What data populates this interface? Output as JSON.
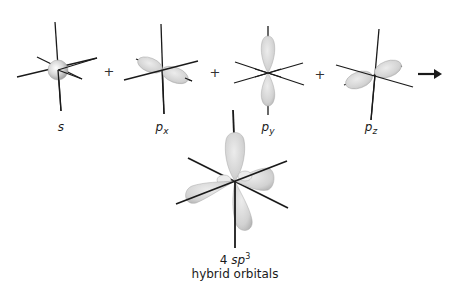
{
  "figure": {
    "orbitals": [
      {
        "id": "s",
        "symbol": "s",
        "subscript": ""
      },
      {
        "id": "px",
        "symbol": "p",
        "subscript": "x"
      },
      {
        "id": "py",
        "symbol": "p",
        "subscript": "y"
      },
      {
        "id": "pz",
        "symbol": "p",
        "subscript": "z"
      }
    ],
    "operators": [
      "+",
      "+",
      "+"
    ],
    "arrow": "→",
    "result": {
      "count": "4",
      "symbol": "sp",
      "superscript": "3",
      "description": "hybrid orbitals"
    },
    "colors": {
      "lobe_fill": "#d9d9d9",
      "lobe_stroke": "#a8a8a8",
      "axis": "#1a1a1a"
    }
  }
}
